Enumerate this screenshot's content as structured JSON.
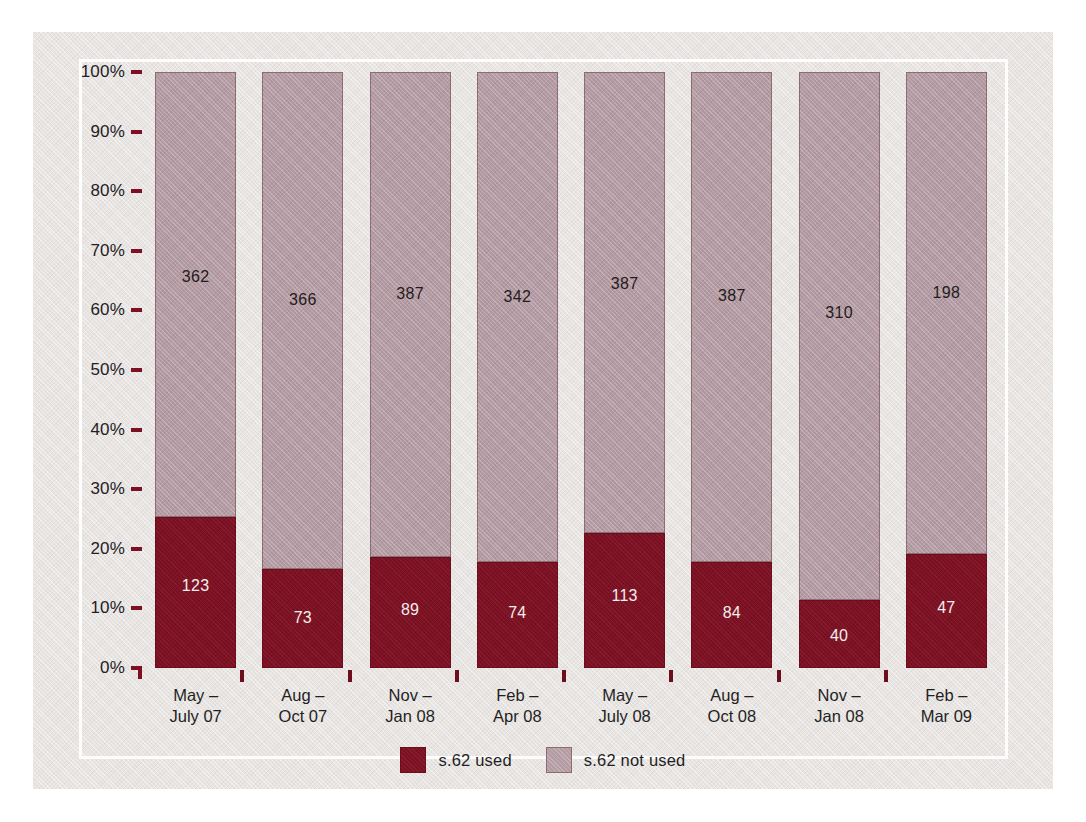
{
  "figure": {
    "background_color": "#e7e4e2",
    "frame_color": "#fdfdfd"
  },
  "chart_data": {
    "type": "bar",
    "subtype": "stacked-100-percent",
    "title": "",
    "xlabel": "",
    "ylabel": "",
    "ylim": [
      0,
      100
    ],
    "grid": false,
    "legend_position": "bottom-center",
    "ytick_labels": [
      "100%",
      "90%",
      "80%",
      "70%",
      "60%",
      "50%",
      "40%",
      "30%",
      "20%",
      "10%",
      "0%"
    ],
    "ytick_values": [
      100,
      90,
      80,
      70,
      60,
      50,
      40,
      30,
      20,
      10,
      0
    ],
    "categories": [
      "May –\nJuly 07",
      "Aug –\nOct 07",
      "Nov –\nJan 08",
      "Feb –\nApr 08",
      "May –\nJuly 08",
      "Aug –\nOct 08",
      "Nov –\nJan 08",
      "Feb –\nMar 09"
    ],
    "category_lines": [
      [
        "May –",
        "July 07"
      ],
      [
        "Aug –",
        "Oct 07"
      ],
      [
        "Nov –",
        "Jan 08"
      ],
      [
        "Feb –",
        "Apr 08"
      ],
      [
        "May –",
        "July 08"
      ],
      [
        "Aug –",
        "Oct 08"
      ],
      [
        "Nov –",
        "Jan 08"
      ],
      [
        "Feb –",
        "Mar 09"
      ]
    ],
    "series": [
      {
        "name": "s.62 used",
        "color": "#7d1022",
        "values": [
          123,
          73,
          89,
          74,
          113,
          84,
          40,
          47
        ],
        "percentages": [
          25.4,
          16.6,
          18.7,
          17.8,
          22.6,
          17.8,
          11.4,
          19.2
        ]
      },
      {
        "name": "s.62 not used",
        "color": "#b49ba3",
        "values": [
          362,
          366,
          387,
          342,
          387,
          387,
          310,
          198
        ],
        "percentages": [
          74.6,
          83.4,
          81.3,
          82.2,
          77.4,
          82.2,
          88.6,
          80.8
        ]
      }
    ],
    "totals": [
      485,
      439,
      476,
      416,
      500,
      471,
      350,
      245
    ]
  },
  "legend": {
    "items": [
      {
        "label": "s.62 used",
        "swatch": "legend-swatch-used"
      },
      {
        "label": "s.62 not used",
        "swatch": "legend-swatch-not-used"
      }
    ]
  }
}
